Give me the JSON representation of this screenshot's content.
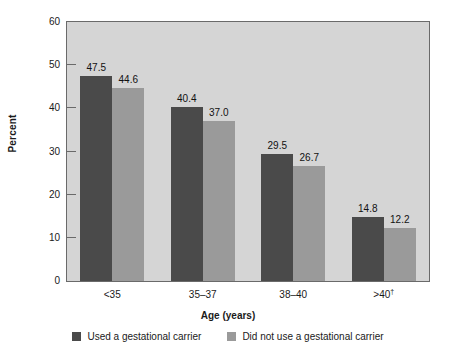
{
  "chart_data": {
    "type": "bar",
    "title": "",
    "subtitle": "",
    "xlabel": "Age (years)",
    "ylabel": "Percent",
    "categories": [
      "<35",
      "35–37",
      "38–40",
      ">40†"
    ],
    "category_plain": [
      "<35",
      "35-37",
      "38-40",
      ">40"
    ],
    "category_footnote_marker": "†",
    "series": [
      {
        "name": "Used a gestational carrier",
        "color": "#4a4a4a",
        "values": [
          47.5,
          40.4,
          29.5,
          14.8
        ],
        "labels": [
          "47.5",
          "40.4",
          "29.5",
          "14.8"
        ]
      },
      {
        "name": "Did not use a gestational carrier",
        "color": "#9a9a9a",
        "values": [
          44.6,
          37.0,
          26.7,
          12.2
        ],
        "labels": [
          "44.6",
          "37.0",
          "26.7",
          "12.2"
        ]
      }
    ],
    "ylim": [
      0,
      60
    ],
    "yticks": [
      0,
      10,
      20,
      30,
      40,
      50,
      60
    ],
    "ytick_labels": [
      "0",
      "10",
      "20",
      "30",
      "40",
      "50",
      "60"
    ],
    "grid": false,
    "legend_position": "bottom",
    "plot_background": "#d5d5d5",
    "figure_background": "#ffffff",
    "axis_color": "#6a6a6a"
  },
  "axes": {
    "y_title": "Percent",
    "x_title": "Age (years)"
  },
  "legend": {
    "items": [
      {
        "label": "Used a gestational carrier",
        "color": "#4a4a4a"
      },
      {
        "label": "Did not use a gestational carrier",
        "color": "#9a9a9a"
      }
    ]
  }
}
